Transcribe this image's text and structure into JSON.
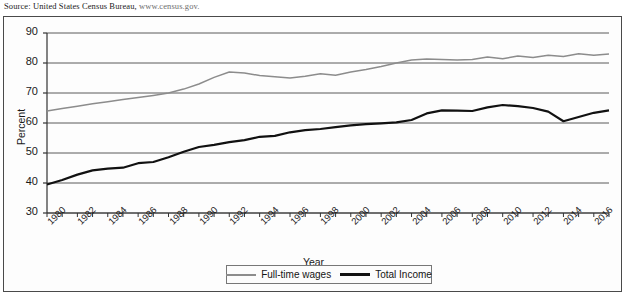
{
  "source": {
    "prefix": "Source: United States Census Bureau,",
    "url": "www.census.gov."
  },
  "legend": {
    "wages_label": "Full-time wages",
    "income_label": "Total Income"
  },
  "colors": {
    "wages": "#8c8c8c",
    "income": "#111111",
    "grid": "#5a5a5a",
    "axis": "#333333"
  },
  "chart_data": {
    "type": "line",
    "title": "",
    "xlabel": "Year",
    "ylabel": "Percent",
    "ylim": [
      30,
      90
    ],
    "xlim": [
      1980,
      2017
    ],
    "ytick_labels": [
      "30",
      "40",
      "50",
      "60",
      "70",
      "80",
      "90"
    ],
    "yticks": [
      30,
      40,
      50,
      60,
      70,
      80,
      90
    ],
    "xtick_labels": [
      "1980",
      "1982",
      "1984",
      "1986",
      "1988",
      "1990",
      "1992",
      "1994",
      "1996",
      "1998",
      "2000",
      "2002",
      "2004",
      "2006",
      "2008",
      "2010",
      "2012",
      "2014",
      "2016"
    ],
    "xticks": [
      1980,
      1982,
      1984,
      1986,
      1988,
      1990,
      1992,
      1994,
      1996,
      1998,
      2000,
      2002,
      2004,
      2006,
      2008,
      2010,
      2012,
      2014,
      2016
    ],
    "grid": true,
    "legend_position": "below-axes",
    "x": [
      1980,
      1981,
      1982,
      1983,
      1984,
      1985,
      1986,
      1987,
      1988,
      1989,
      1990,
      1991,
      1992,
      1993,
      1994,
      1995,
      1996,
      1997,
      1998,
      1999,
      2000,
      2001,
      2002,
      2003,
      2004,
      2005,
      2006,
      2007,
      2008,
      2009,
      2010,
      2011,
      2012,
      2013,
      2014,
      2015,
      2016,
      2017
    ],
    "series": [
      {
        "name": "Full-time wages",
        "color": "#8c8c8c",
        "values": [
          64.0,
          64.8,
          65.6,
          66.4,
          67.1,
          67.8,
          68.5,
          69.2,
          70.0,
          71.3,
          73.0,
          75.2,
          77.0,
          76.7,
          75.8,
          75.4,
          75.0,
          75.6,
          76.4,
          75.9,
          77.0,
          77.8,
          78.8,
          80.0,
          81.0,
          81.3,
          81.2,
          81.0,
          81.2,
          82.0,
          81.4,
          82.3,
          81.8,
          82.6,
          82.2,
          83.1,
          82.6,
          83.0
        ]
      },
      {
        "name": "Total Income",
        "color": "#111111",
        "values": [
          39.5,
          41.0,
          42.8,
          44.2,
          44.8,
          45.1,
          46.6,
          47.0,
          48.6,
          50.4,
          52.0,
          52.7,
          53.6,
          54.3,
          55.4,
          55.7,
          56.9,
          57.6,
          58.0,
          58.6,
          59.2,
          59.6,
          59.9,
          60.2,
          61.0,
          63.2,
          64.2,
          64.1,
          64.0,
          65.2,
          66.0,
          65.6,
          65.0,
          63.8,
          60.6,
          62.0,
          63.4,
          64.2
        ]
      }
    ]
  }
}
